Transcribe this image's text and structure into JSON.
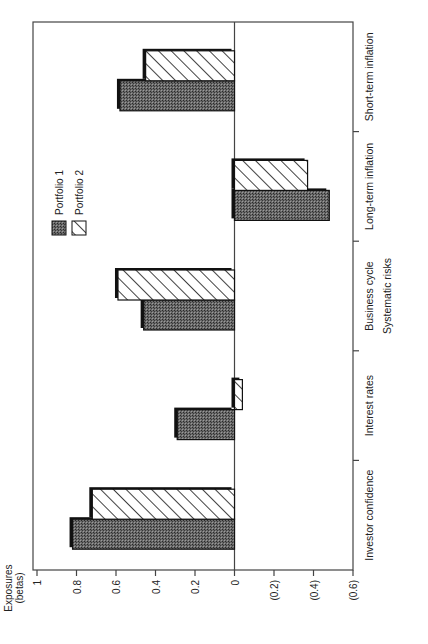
{
  "chart_data": {
    "type": "bar",
    "orientation": "rotated-90-ccw (vertical bars drawn, page rotated)",
    "title": "",
    "xlabel": "Systematic risks",
    "ylabel": "Exposures (betas)",
    "ylabel_lines": [
      "Exposures",
      "(betas)"
    ],
    "ylim": [
      -0.6,
      1.0
    ],
    "yticks": [
      1,
      0.8,
      0.6,
      0.4,
      0.2,
      0,
      -0.2,
      -0.4,
      -0.6
    ],
    "ytick_labels": [
      "1",
      "0.8",
      "0.6",
      "0.4",
      "0.2",
      "0",
      "(0.2)",
      "(0.4)",
      "(0.6)"
    ],
    "grid": false,
    "categories": [
      "Investor confidence",
      "Interest rates",
      "Business cycle",
      "Long-term inflation",
      "Short-term inflation"
    ],
    "series": [
      {
        "name": "Portfolio 1",
        "pattern": "dark-stipple",
        "color": "#555555",
        "values": [
          0.82,
          0.29,
          0.46,
          -0.48,
          0.58
        ]
      },
      {
        "name": "Portfolio 2",
        "pattern": "diagonal-hatch",
        "color": "#ffffff",
        "values": [
          0.72,
          -0.04,
          0.59,
          -0.37,
          0.45
        ]
      }
    ],
    "legend": {
      "position": "upper-left (inside plot)",
      "entries": [
        "Portfolio 1",
        "Portfolio 2"
      ]
    }
  }
}
